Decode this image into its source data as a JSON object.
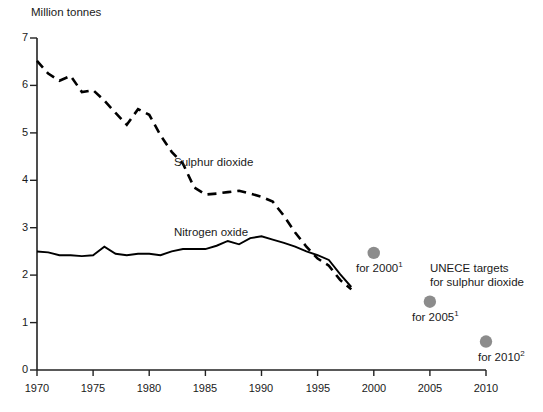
{
  "chart_data": {
    "type": "line",
    "title": "",
    "ylabel": "Million tonnes",
    "xlabel": "",
    "xlim": [
      1970,
      2010
    ],
    "ylim": [
      0,
      7
    ],
    "yticks": [
      "0",
      "1",
      "2",
      "3",
      "4",
      "5",
      "6",
      "7"
    ],
    "xticks": [
      "1970",
      "1975",
      "1980",
      "1985",
      "1990",
      "1995",
      "2000",
      "2005",
      "2010"
    ],
    "grid": false,
    "legend_position": "inline-annotations",
    "x": [
      1970,
      1971,
      1972,
      1973,
      1974,
      1975,
      1976,
      1977,
      1978,
      1979,
      1980,
      1981,
      1982,
      1983,
      1984,
      1985,
      1986,
      1987,
      1988,
      1989,
      1990,
      1991,
      1992,
      1993,
      1994,
      1995,
      1996,
      1997,
      1998
    ],
    "series": [
      {
        "name": "Sulphur dioxide",
        "style": "dashed",
        "color": "#000000",
        "values": [
          6.52,
          6.25,
          6.1,
          6.2,
          5.86,
          5.9,
          5.68,
          5.42,
          5.17,
          5.5,
          5.38,
          4.95,
          4.6,
          4.35,
          3.85,
          3.7,
          3.72,
          3.75,
          3.78,
          3.72,
          3.65,
          3.55,
          3.25,
          2.9,
          2.6,
          2.35,
          2.2,
          1.9,
          1.7
        ]
      },
      {
        "name": "Nitrogen oxide",
        "style": "solid",
        "color": "#000000",
        "values": [
          2.5,
          2.48,
          2.42,
          2.42,
          2.4,
          2.42,
          2.6,
          2.45,
          2.42,
          2.45,
          2.45,
          2.42,
          2.5,
          2.55,
          2.55,
          2.55,
          2.62,
          2.72,
          2.65,
          2.78,
          2.82,
          2.75,
          2.68,
          2.6,
          2.5,
          2.42,
          2.32,
          2.02,
          1.75
        ]
      }
    ],
    "target_points": [
      {
        "name": "for 2000",
        "note": "1",
        "year": 2000,
        "value": 2.47
      },
      {
        "name": "for 2005",
        "note": "1",
        "year": 2005,
        "value": 1.44
      },
      {
        "name": "for 2010",
        "note": "2",
        "year": 2010,
        "value": 0.6
      }
    ],
    "target_point_color": "#8c8c8c",
    "annotations": {
      "series_label_so2": "Sulphur dioxide",
      "series_label_nox": "Nitrogen oxide",
      "legend_line1": "UNECE targets",
      "legend_line2": "for sulphur dioxide"
    }
  },
  "axis": {
    "y_title": "Million tonnes",
    "y_ticks": [
      "7",
      "6",
      "5",
      "4",
      "3",
      "2",
      "1",
      "0"
    ],
    "x_ticks": [
      "1970",
      "1975",
      "1980",
      "1985",
      "1990",
      "1995",
      "2000",
      "2005",
      "2010"
    ]
  },
  "labels": {
    "sulphur_dioxide": "Sulphur dioxide",
    "nitrogen_oxide": "Nitrogen oxide",
    "target_2000": "for 2000",
    "target_2000_sup": "1",
    "target_2005": "for 2005",
    "target_2005_sup": "1",
    "target_2010": "for 2010",
    "target_2010_sup": "2",
    "unece_line1": "UNECE targets",
    "unece_line2": "for sulphur dioxide"
  }
}
